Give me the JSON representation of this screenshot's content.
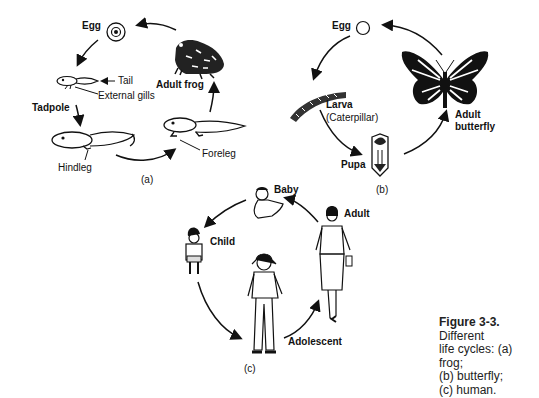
{
  "figure": {
    "caption_bold": "Figure 3-3.",
    "caption_lines": [
      "Different",
      "life cycles: (a) frog;",
      "(b) butterfly;",
      "(c) human."
    ]
  },
  "frog_cycle": {
    "panel_label": "(a)",
    "stages": [
      "Egg",
      "Tadpole",
      "Adult frog"
    ],
    "annotations": [
      "Tail",
      "External gills",
      "Hindleg",
      "Foreleg"
    ]
  },
  "butterfly_cycle": {
    "panel_label": "(b)",
    "stages": [
      "Egg",
      "Larva",
      "(Caterpillar)",
      "Pupa",
      "Adult",
      "butterfly"
    ]
  },
  "human_cycle": {
    "panel_label": "(c)",
    "stages": [
      "Baby",
      "Adult",
      "Child",
      "Adolescent"
    ]
  }
}
